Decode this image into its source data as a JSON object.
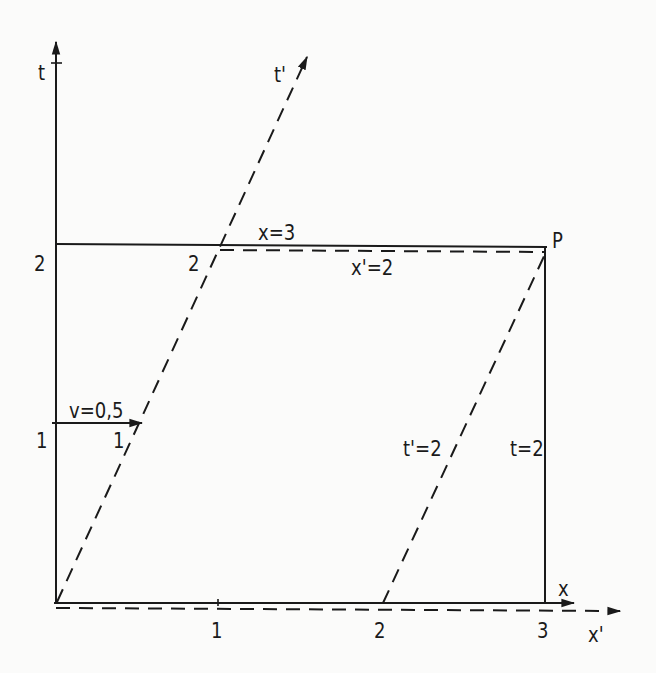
{
  "diagram": {
    "type": "spacetime-diagram",
    "colors": {
      "ink": "#1a1a1a",
      "background": "#fbfbfa"
    },
    "axes": {
      "t": "t",
      "t_prime": "t'",
      "x": "x",
      "x_prime": "x'"
    },
    "ticks": {
      "t": [
        "1",
        "2"
      ],
      "x": [
        "1",
        "2",
        "3"
      ],
      "t_prime": [
        "1",
        "2"
      ]
    },
    "annotations": {
      "velocity": "v=0,5",
      "x_eq": "x=3",
      "x_prime_eq": "x'=2",
      "t_prime_eq": "t'=2",
      "t_eq": "t=2",
      "event": "P"
    }
  }
}
